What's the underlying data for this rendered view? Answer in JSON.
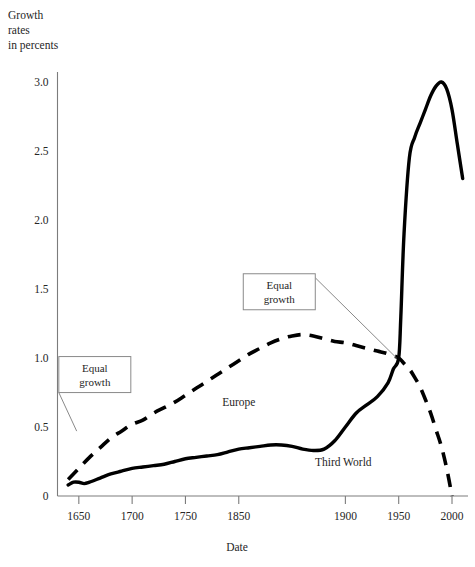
{
  "chart_data": {
    "type": "line",
    "title": "",
    "ylabel_lines": [
      "Growth",
      "rates",
      "in percents"
    ],
    "xlabel": "Date",
    "xlim": [
      1630,
      2015
    ],
    "ylim": [
      0,
      3.15
    ],
    "grid": false,
    "legend_position": "inline-labels",
    "xticks": [
      1650,
      1700,
      1750,
      1850,
      1900,
      1950,
      2000
    ],
    "xtick_labels": [
      "1650",
      "1700",
      "1750",
      "1850",
      "1900",
      "1950",
      "2000"
    ],
    "xtick_positions_year": [
      1650,
      1700,
      1750,
      1800,
      1900,
      1950,
      2000
    ],
    "yticks": [
      0,
      0.5,
      1.0,
      1.5,
      2.0,
      2.5,
      3.0
    ],
    "ytick_labels": [
      "0",
      "0.5",
      "1.0",
      "1.5",
      "2.0",
      "2.5",
      "3.0"
    ],
    "series": [
      {
        "name": "Europe",
        "style": "dashed",
        "color": "#000000",
        "x": [
          1640,
          1650,
          1660,
          1670,
          1680,
          1690,
          1700,
          1710,
          1720,
          1730,
          1740,
          1750,
          1760,
          1770,
          1780,
          1790,
          1800,
          1810,
          1820,
          1830,
          1840,
          1850,
          1860,
          1870,
          1880,
          1890,
          1900,
          1910,
          1920,
          1930,
          1940,
          1950,
          1955,
          1960,
          1965,
          1970,
          1975,
          1980,
          1985,
          1990,
          1995,
          2000
        ],
        "values": [
          0.12,
          0.2,
          0.28,
          0.35,
          0.42,
          0.47,
          0.52,
          0.55,
          0.6,
          0.64,
          0.68,
          0.73,
          0.78,
          0.83,
          0.88,
          0.93,
          0.98,
          1.03,
          1.07,
          1.11,
          1.14,
          1.16,
          1.17,
          1.16,
          1.14,
          1.12,
          1.11,
          1.09,
          1.07,
          1.05,
          1.03,
          1.0,
          0.96,
          0.92,
          0.86,
          0.79,
          0.7,
          0.6,
          0.48,
          0.36,
          0.2,
          0.0
        ]
      },
      {
        "name": "Third World",
        "style": "solid",
        "color": "#000000",
        "x": [
          1640,
          1645,
          1650,
          1655,
          1660,
          1670,
          1680,
          1690,
          1700,
          1710,
          1720,
          1730,
          1740,
          1750,
          1760,
          1770,
          1780,
          1790,
          1800,
          1810,
          1820,
          1830,
          1840,
          1850,
          1860,
          1870,
          1880,
          1890,
          1900,
          1910,
          1920,
          1930,
          1940,
          1945,
          1950,
          1952,
          1955,
          1960,
          1965,
          1970,
          1975,
          1980,
          1985,
          1990,
          1995,
          2000,
          2005,
          2010
        ],
        "values": [
          0.08,
          0.1,
          0.1,
          0.09,
          0.1,
          0.13,
          0.16,
          0.18,
          0.2,
          0.21,
          0.22,
          0.23,
          0.25,
          0.27,
          0.28,
          0.29,
          0.3,
          0.32,
          0.34,
          0.35,
          0.36,
          0.37,
          0.37,
          0.36,
          0.34,
          0.33,
          0.34,
          0.4,
          0.5,
          0.6,
          0.66,
          0.72,
          0.82,
          0.92,
          1.0,
          1.3,
          1.9,
          2.45,
          2.6,
          2.7,
          2.8,
          2.9,
          2.97,
          3.0,
          2.95,
          2.8,
          2.55,
          2.3
        ]
      }
    ],
    "annotations": [
      {
        "id": "equal-growth-left",
        "lines": [
          "Equal",
          "growth"
        ],
        "box_x_year": 1665,
        "box_y_value": 0.88,
        "leader_to_x_year": 1648,
        "leader_to_y_value": 0.47
      },
      {
        "id": "equal-growth-right",
        "lines": [
          "Equal",
          "growth"
        ],
        "box_x_year": 1838,
        "box_y_value": 1.48,
        "leader_to_x_year": 1948,
        "leader_to_y_value": 1.0
      }
    ],
    "series_inline_labels": [
      {
        "name": "Europe",
        "x_year": 1800,
        "y_value": 0.65
      },
      {
        "name": "Third World",
        "x_year": 1898,
        "y_value": 0.22
      }
    ]
  }
}
